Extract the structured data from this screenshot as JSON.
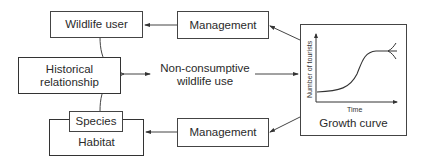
{
  "diagram": {
    "nodes": {
      "wildlife_user": "Wildlife user",
      "historical_relationship": [
        "Historical",
        "relationship"
      ],
      "species": "Species",
      "habitat": "Habitat",
      "management_top": "Management",
      "management_bottom": "Management",
      "center": [
        "Non-consumptive",
        "wildlife use"
      ],
      "growth_curve": "Growth curve"
    },
    "growth_chart": {
      "ylabel": "Number of tourists",
      "xlabel": "Time"
    },
    "edges": [
      {
        "from": "wildlife_user",
        "to": "center"
      },
      {
        "from": "historical_relationship",
        "to": "center"
      },
      {
        "from": "species",
        "to": "center"
      },
      {
        "from": "center",
        "to": "growth_curve"
      },
      {
        "from": "growth_curve",
        "to": "management_top"
      },
      {
        "from": "growth_curve",
        "to": "management_bottom"
      },
      {
        "from": "management_top",
        "to": "wildlife_user"
      },
      {
        "from": "management_bottom",
        "to": "habitat"
      }
    ],
    "colors": {
      "line": "#444444",
      "background": "#ffffff"
    }
  }
}
